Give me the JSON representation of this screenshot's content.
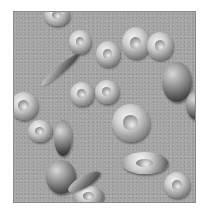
{
  "image": {
    "subject": "red blood cells illustration",
    "background_color": "#a3a3a3",
    "cells": [
      {
        "kind": "donut",
        "x": 30,
        "y": -8,
        "w": 26,
        "h": 22
      },
      {
        "kind": "donut",
        "x": 55,
        "y": 18,
        "w": 22,
        "h": 24
      },
      {
        "kind": "donut",
        "x": 82,
        "y": 29,
        "w": 24,
        "h": 26
      },
      {
        "kind": "donut",
        "x": 108,
        "y": 15,
        "w": 28,
        "h": 32
      },
      {
        "kind": "donut",
        "x": 133,
        "y": 20,
        "w": 26,
        "h": 28
      },
      {
        "kind": "dark",
        "x": 148,
        "y": 50,
        "w": 30,
        "h": 40
      },
      {
        "kind": "donut",
        "x": 56,
        "y": 70,
        "w": 24,
        "h": 24
      },
      {
        "kind": "donut",
        "x": 81,
        "y": 68,
        "w": 24,
        "h": 24
      },
      {
        "kind": "donut",
        "x": -4,
        "y": 80,
        "w": 28,
        "h": 28
      },
      {
        "kind": "dark",
        "x": 172,
        "y": 78,
        "w": 22,
        "h": 30
      },
      {
        "kind": "donut",
        "x": 98,
        "y": 92,
        "w": 38,
        "h": 38
      },
      {
        "kind": "donut",
        "x": 14,
        "y": 108,
        "w": 24,
        "h": 22
      },
      {
        "kind": "dark",
        "x": 40,
        "y": 108,
        "w": 18,
        "h": 36
      },
      {
        "kind": "donut",
        "x": 108,
        "y": 140,
        "w": 46,
        "h": 22
      },
      {
        "kind": "dark",
        "x": 32,
        "y": 148,
        "w": 30,
        "h": 34
      },
      {
        "kind": "donut",
        "x": 60,
        "y": 174,
        "w": 30,
        "h": 20
      },
      {
        "kind": "donut",
        "x": 150,
        "y": 160,
        "w": 26,
        "h": 26
      }
    ],
    "sickles": [
      {
        "x": 22,
        "y": 54,
        "w": 48,
        "h": 8,
        "rot": -40
      },
      {
        "x": 52,
        "y": 164,
        "w": 36,
        "h": 12,
        "rot": -30
      }
    ]
  }
}
